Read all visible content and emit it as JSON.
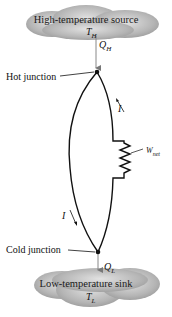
{
  "diagram": {
    "type": "thermoelectric-power-generator",
    "source": {
      "title": "High-temperature source",
      "temp_symbol": "T",
      "temp_sub": "H"
    },
    "sink": {
      "title": "Low-temperature sink",
      "temp_symbol": "T",
      "temp_sub": "L"
    },
    "heat_in": {
      "symbol": "Q",
      "sub": "H"
    },
    "heat_out": {
      "symbol": "Q",
      "sub": "L"
    },
    "hot_junction_label": "Hot junction",
    "cold_junction_label": "Cold junction",
    "current_label_top": "I",
    "current_label_bottom": "I",
    "work": {
      "symbol": "W",
      "sub": "net"
    },
    "colors": {
      "cloud": "#a9a9a9",
      "wire": "#111111",
      "arrow": "#888888"
    }
  }
}
